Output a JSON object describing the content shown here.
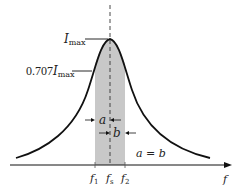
{
  "diagram": {
    "curve": {
      "type": "bell",
      "color": "#111111"
    },
    "shade_color": "#c8c8c8",
    "labels": {
      "imax_main": "I",
      "imax_sub": "max",
      "half_power_coef": "0.707",
      "half_power_main": "I",
      "half_power_sub": "max",
      "a": "a",
      "b": "b",
      "equation": "a = b",
      "f1_main": "f",
      "f1_sub": "1",
      "fs_main": "f",
      "fs_sub": "s",
      "f2_main": "f",
      "f2_sub": "2",
      "x_axis": "f"
    }
  }
}
